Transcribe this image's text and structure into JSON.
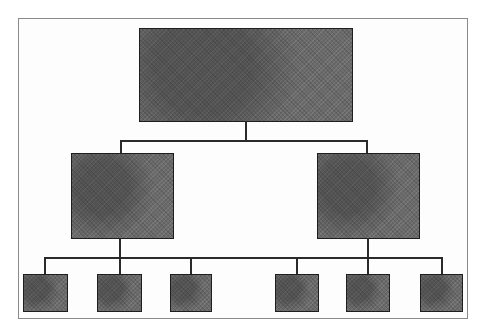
{
  "diagram": {
    "type": "org-chart",
    "levels": 3,
    "root": {
      "label": ""
    },
    "level2": [
      {
        "label": ""
      },
      {
        "label": ""
      }
    ],
    "level3": [
      {
        "label": ""
      },
      {
        "label": ""
      },
      {
        "label": ""
      },
      {
        "label": ""
      },
      {
        "label": ""
      },
      {
        "label": ""
      }
    ],
    "colors": {
      "node_fill": "#6a6a6a",
      "node_border": "#1e1e1e",
      "connector": "#2a2a2a",
      "frame": "#8a8a8a"
    }
  }
}
